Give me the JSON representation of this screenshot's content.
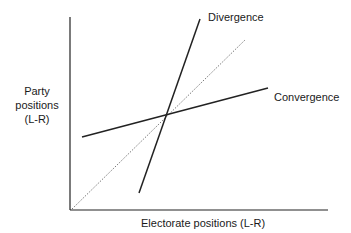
{
  "diagram": {
    "y_axis_label_lines": [
      "Party",
      "positions",
      "(L-R)"
    ],
    "x_axis_label": "Electorate positions (L-R)",
    "lines": [
      {
        "name": "45-degree reference",
        "style": "dotted",
        "label": ""
      },
      {
        "name": "Divergence",
        "style": "solid",
        "label": "Divergence"
      },
      {
        "name": "Convergence",
        "style": "solid",
        "label": "Convergence"
      }
    ],
    "colors": {
      "line": "#222222",
      "dotted": "#555555",
      "text": "#1a1a1a"
    }
  }
}
